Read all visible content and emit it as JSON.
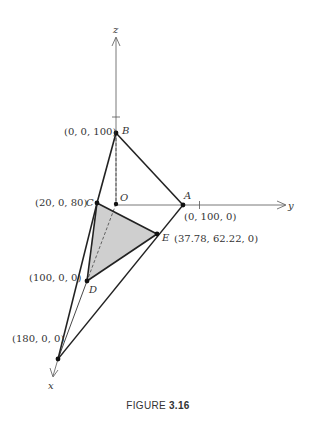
{
  "figure": {
    "caption_prefix": "FIGURE",
    "caption_number": "3.16"
  },
  "axes": {
    "x_label": "x",
    "y_label": "y",
    "z_label": "z"
  },
  "points": {
    "O": {
      "name": "O",
      "coords": ""
    },
    "A": {
      "name": "A",
      "coords": "(0, 100, 0)"
    },
    "B": {
      "name": "B",
      "coords": "(0, 0, 100)"
    },
    "C": {
      "name": "C",
      "coords": "(20, 0, 80)"
    },
    "D": {
      "name": "D",
      "coords": "(100, 0, 0)"
    },
    "E": {
      "name": "E",
      "coords": "(37.78, 62.22, 0)"
    },
    "X": {
      "name": "",
      "coords": "(180, 0, 0)"
    }
  },
  "colors": {
    "ink": "#222222",
    "shade": "#cfcfcf",
    "axis": "#555555"
  }
}
